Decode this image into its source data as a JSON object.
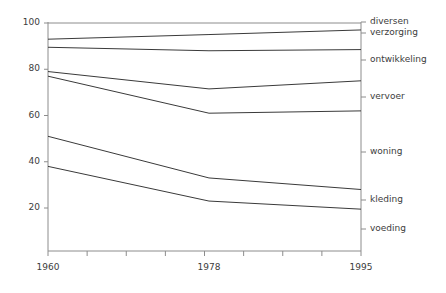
{
  "chart_data": {
    "type": "line",
    "title": "",
    "subtitle": "",
    "xlabel": "",
    "ylabel": "",
    "x": [
      1960,
      1978,
      1995
    ],
    "xtick_labels": [
      "1960",
      "1978",
      "1995"
    ],
    "ytick_labels": [
      "20",
      "40",
      "60",
      "80",
      "100"
    ],
    "ytick_values": [
      20,
      40,
      60,
      80,
      100
    ],
    "xlim": [
      1960,
      1995
    ],
    "ylim": [
      0,
      100
    ],
    "grid": false,
    "legend_position": "right-inline",
    "note": "cumulatieve percentages huishoudbestedingen",
    "series": [
      {
        "name": "voeding",
        "values": [
          38,
          23,
          19.5
        ]
      },
      {
        "name": "kleding",
        "values": [
          51,
          33,
          28
        ]
      },
      {
        "name": "woning",
        "values": [
          77,
          61,
          62
        ]
      },
      {
        "name": "vervoer",
        "values": [
          79,
          71.5,
          75
        ]
      },
      {
        "name": "ontwikkeling",
        "values": [
          89.5,
          88,
          88.5
        ]
      },
      {
        "name": "verzorging",
        "values": [
          93,
          95,
          97
        ]
      },
      {
        "name": "diversen",
        "values": [
          100,
          100,
          100
        ]
      }
    ],
    "colors": {
      "line": "#3a3a3a",
      "axis": "#8c8c8c",
      "text": "#3c3c3c",
      "background": "#ffffff"
    }
  },
  "axis": {
    "y_ticks": [
      {
        "label": "100",
        "value": 100
      },
      {
        "label": "80",
        "value": 80
      },
      {
        "label": "60",
        "value": 60
      },
      {
        "label": "40",
        "value": 40
      },
      {
        "label": "20",
        "value": 20
      }
    ],
    "x_ticks": [
      {
        "label": "1960",
        "value": 1960
      },
      {
        "label": "1978",
        "value": 1978
      },
      {
        "label": "1995",
        "value": 1995
      }
    ]
  },
  "series_labels": [
    {
      "name": "diversen"
    },
    {
      "name": "verzorging"
    },
    {
      "name": "ontwikkeling"
    },
    {
      "name": "vervoer"
    },
    {
      "name": "woning"
    },
    {
      "name": "kleding"
    },
    {
      "name": "voeding"
    }
  ]
}
